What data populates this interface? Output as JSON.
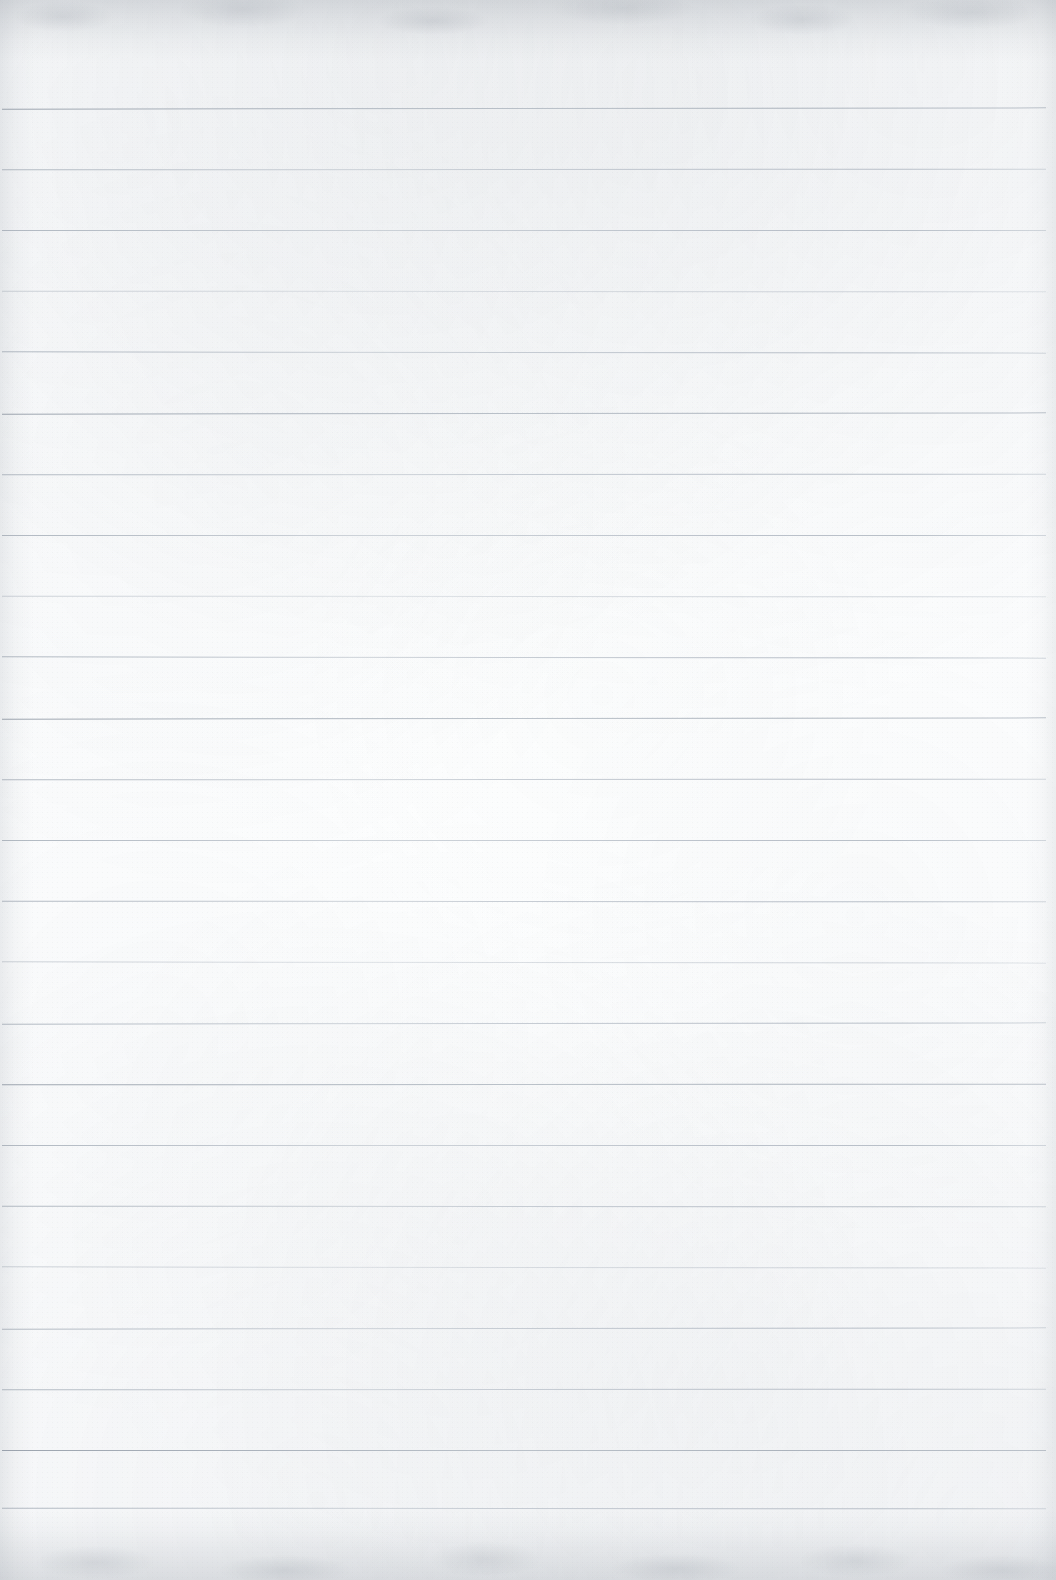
{
  "document": {
    "kind": "ruled-notebook-paper",
    "title": "Blank lined notebook page",
    "content_text": "",
    "has_handwriting": false,
    "has_printed_text": false
  },
  "page": {
    "width": 1056,
    "height": 1580,
    "background_color": "#fbfcfd",
    "paper_tone": "off-white",
    "texture": "fibrous paper grain with mottled scan noise"
  },
  "ruling": {
    "style": "wide-ruled horizontal lines",
    "line_color": "#b4bcc6",
    "line_thickness_px": 1,
    "line_count": 23,
    "first_line_y": 108,
    "line_spacing_px": 61,
    "line_start_x": 2,
    "line_end_x": 1046,
    "margin_rule": "none",
    "lines_y": [
      108,
      169,
      230,
      291,
      352,
      413,
      474,
      535,
      596,
      657,
      718,
      779,
      840,
      901,
      962,
      1023,
      1084,
      1145,
      1206,
      1267,
      1328,
      1389,
      1450,
      1508
    ],
    "heavy_line_indices": [
      0,
      5,
      10,
      16,
      22
    ],
    "faint_line_indices": [
      3,
      8,
      14,
      19
    ]
  },
  "edges": {
    "top_band_color": "#848c96",
    "top_band_height": 62,
    "bottom_band_color": "#848c96",
    "bottom_band_height": 70,
    "left_shadow_width": 34,
    "right_shadow_width": 30
  }
}
